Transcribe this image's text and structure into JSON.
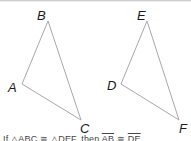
{
  "diagram": {
    "triangle_left": {
      "vertices": [
        "A",
        "B",
        "C"
      ],
      "labels": {
        "A": "A",
        "B": "B",
        "C": "C"
      }
    },
    "triangle_right": {
      "vertices": [
        "D",
        "E",
        "F"
      ],
      "labels": {
        "D": "D",
        "E": "E",
        "F": "F"
      }
    },
    "stroke_color": "#a8a8a8",
    "caption": {
      "prefix": "If △ABC ≅ △DEF, then",
      "seg1": "AB",
      "mid": " ≅ ",
      "seg2": "DE"
    }
  }
}
